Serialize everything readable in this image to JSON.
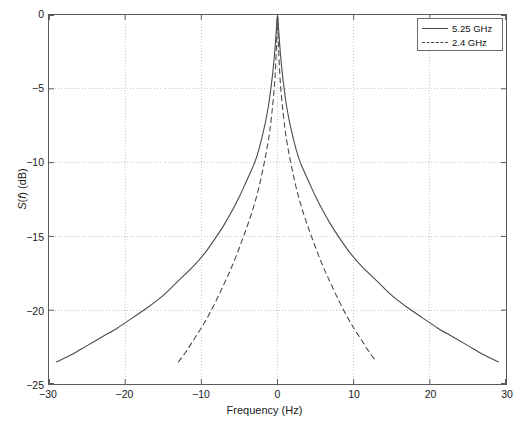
{
  "chart_data": {
    "type": "line",
    "title": "",
    "xlabel": "Frequency (Hz)",
    "ylabel": "S(f) (dB)",
    "ylabel_parts": {
      "pre": "S(",
      "italic": "f",
      "post": ") (dB)"
    },
    "xlim": [
      -30,
      30
    ],
    "ylim": [
      -25,
      0
    ],
    "xticks": [
      -30,
      -20,
      -10,
      0,
      10,
      20,
      30
    ],
    "xticklabels": [
      "-30",
      "-20",
      "-10",
      "0",
      "10",
      "20",
      "30"
    ],
    "yticks": [
      0,
      -5,
      -10,
      -15,
      -20,
      -25
    ],
    "yticklabels": [
      "0",
      "-5",
      "-10",
      "-15",
      "-20",
      "-25"
    ],
    "grid": true,
    "grid_style": "dotted",
    "grid_color": "#c8c8c8",
    "axis_color": "#5a5a5a",
    "background": "#ffffff",
    "legend_position": "upper right",
    "series": [
      {
        "name": "5.25 GHz",
        "style": "solid",
        "color": "#4a4a4a",
        "x": [
          -29.0,
          -27.0,
          -25.0,
          -23.0,
          -21.0,
          -19.0,
          -17.0,
          -15.0,
          -13.0,
          -11.0,
          -9.5,
          -8.0,
          -7.0,
          -6.0,
          -5.0,
          -4.2,
          -3.5,
          -3.0,
          -2.5,
          -2.0,
          -1.6,
          -1.2,
          -0.9,
          -0.6,
          -0.35,
          -0.15,
          0.0,
          0.15,
          0.35,
          0.6,
          0.9,
          1.2,
          1.6,
          2.0,
          2.5,
          3.0,
          3.5,
          4.2,
          5.0,
          6.0,
          7.0,
          8.0,
          9.5,
          11.0,
          13.0,
          15.0,
          17.0,
          19.0,
          21.0,
          23.0,
          25.0,
          27.0,
          29.0
        ],
        "y": [
          -23.5,
          -23.0,
          -22.4,
          -21.8,
          -21.2,
          -20.5,
          -19.8,
          -19.0,
          -18.0,
          -17.0,
          -16.1,
          -15.0,
          -14.2,
          -13.3,
          -12.3,
          -11.4,
          -10.6,
          -10.0,
          -9.2,
          -8.2,
          -7.3,
          -6.2,
          -5.1,
          -3.8,
          -2.4,
          -1.0,
          0.0,
          -1.0,
          -2.4,
          -3.8,
          -5.1,
          -6.2,
          -7.3,
          -8.2,
          -9.2,
          -10.0,
          -10.6,
          -11.4,
          -12.3,
          -13.3,
          -14.2,
          -15.0,
          -16.1,
          -17.0,
          -18.0,
          -19.0,
          -19.8,
          -20.5,
          -21.2,
          -21.8,
          -22.4,
          -23.0,
          -23.5
        ]
      },
      {
        "name": "2.4 GHz",
        "style": "dashed",
        "color": "#4a4a4a",
        "x": [
          -13.0,
          -12.0,
          -11.0,
          -10.0,
          -9.0,
          -8.0,
          -7.0,
          -6.2,
          -5.4,
          -4.6,
          -3.9,
          -3.2,
          -2.6,
          -2.1,
          -1.7,
          -1.3,
          -1.0,
          -0.75,
          -0.5,
          -0.3,
          -0.12,
          0.0,
          0.12,
          0.3,
          0.5,
          0.75,
          1.0,
          1.3,
          1.7,
          2.1,
          2.6,
          3.2,
          3.9,
          4.6,
          5.4,
          6.2,
          7.0,
          8.0,
          9.0,
          10.0,
          11.0,
          12.0,
          13.0
        ],
        "y": [
          -23.5,
          -22.8,
          -22.0,
          -21.2,
          -20.3,
          -19.3,
          -18.2,
          -17.3,
          -16.3,
          -15.2,
          -14.2,
          -13.1,
          -12.0,
          -10.9,
          -9.9,
          -8.8,
          -7.8,
          -6.7,
          -5.4,
          -4.0,
          -1.9,
          0.0,
          -1.9,
          -4.0,
          -5.4,
          -6.7,
          -7.8,
          -8.8,
          -9.9,
          -10.9,
          -12.0,
          -13.1,
          -14.2,
          -15.2,
          -16.3,
          -17.3,
          -18.2,
          -19.3,
          -20.3,
          -21.2,
          -22.0,
          -22.8,
          -23.5
        ]
      }
    ]
  },
  "legend": {
    "entries": [
      {
        "label": "5.25 GHz",
        "style": "solid"
      },
      {
        "label": "2.4 GHz",
        "style": "dashed"
      }
    ]
  }
}
